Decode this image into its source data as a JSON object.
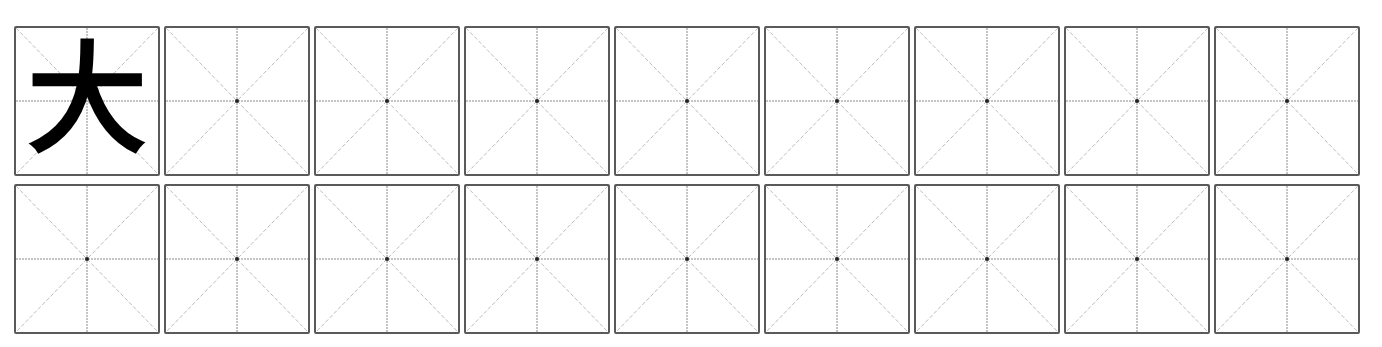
{
  "worksheet": {
    "type": "mizige-practice-grid",
    "rows": 2,
    "columns": 9,
    "colors": {
      "border": "#5a5a5a",
      "guide_solid": "#8a8a8a",
      "guide_dashed": "#bdbdbd",
      "center_dot": "#222222",
      "glyph": "#000000"
    },
    "cells": [
      [
        {
          "char": "大"
        },
        {
          "char": ""
        },
        {
          "char": ""
        },
        {
          "char": ""
        },
        {
          "char": ""
        },
        {
          "char": ""
        },
        {
          "char": ""
        },
        {
          "char": ""
        },
        {
          "char": ""
        }
      ],
      [
        {
          "char": ""
        },
        {
          "char": ""
        },
        {
          "char": ""
        },
        {
          "char": ""
        },
        {
          "char": ""
        },
        {
          "char": ""
        },
        {
          "char": ""
        },
        {
          "char": ""
        },
        {
          "char": ""
        }
      ]
    ]
  }
}
